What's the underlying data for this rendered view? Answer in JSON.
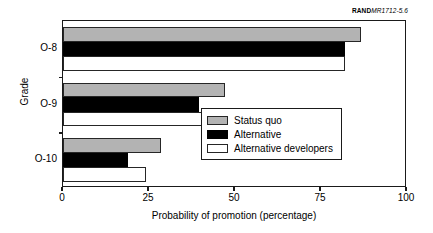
{
  "source_credit": {
    "prefix": "RAND",
    "code": "MR1712-5.6"
  },
  "axes": {
    "y_title": "Grade",
    "x_title": "Probability of promotion (percentage)",
    "x_ticks": [
      "0",
      "25",
      "50",
      "75",
      "100"
    ]
  },
  "legend": {
    "items": [
      {
        "label": "Status quo",
        "swatch": "gray-swatch"
      },
      {
        "label": "Alternative",
        "swatch": "black-swatch"
      },
      {
        "label": "Alternative developers",
        "swatch": "white-swatch"
      }
    ]
  },
  "chart_data": {
    "type": "bar",
    "orientation": "horizontal",
    "title": "",
    "subtitle": "",
    "xlabel": "Probability of promotion (percentage)",
    "ylabel": "Grade",
    "xlim": [
      0,
      100
    ],
    "xticks": [
      0,
      25,
      50,
      75,
      100
    ],
    "grid": false,
    "legend_position": "bottom-right-inside",
    "categories": [
      "O-8",
      "O-9",
      "O-10"
    ],
    "series": [
      {
        "name": "Status quo",
        "color": "#b3b3b3",
        "values": [
          86.5,
          47.0,
          28.5
        ]
      },
      {
        "name": "Alternative",
        "color": "#000000",
        "values": [
          82.0,
          39.5,
          19.0
        ]
      },
      {
        "name": "Alternative developers",
        "color": "#ffffff",
        "values": [
          82.0,
          59.5,
          24.0
        ]
      }
    ]
  }
}
